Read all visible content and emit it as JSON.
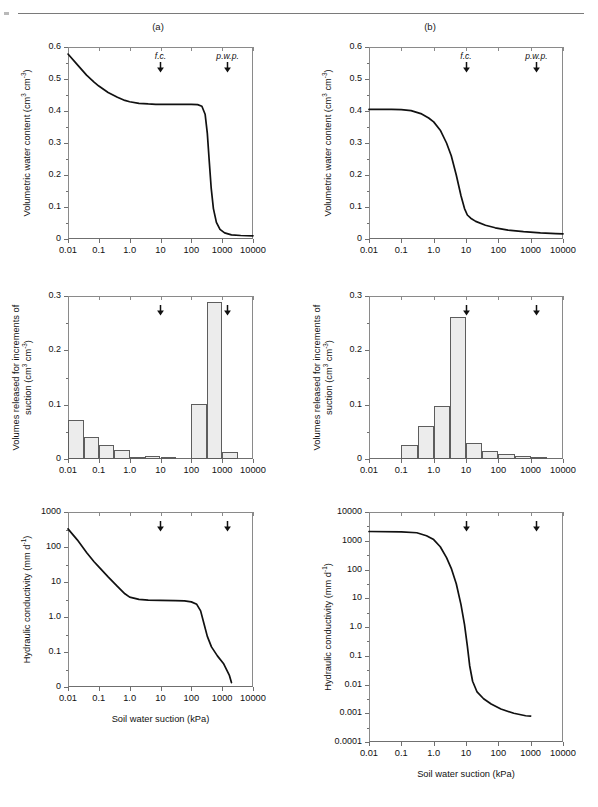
{
  "figure": {
    "panel_labels": [
      "(a)",
      "(b)"
    ],
    "annotations": {
      "fc": "f.c.",
      "pwp": "p.w.p.",
      "fc_x": 10,
      "pwp_x": 1500
    },
    "xaxis_title": "Soil water suction (kPa)",
    "xtick_labels": [
      "0.01",
      "0.1",
      "1.0",
      "10",
      "100",
      "1000",
      "10000"
    ],
    "xtick_values": [
      0.01,
      0.1,
      1,
      10,
      100,
      1000,
      10000
    ],
    "accent_color": "#111111",
    "bar_fill": "#ececec",
    "bar_stroke": "#5d5d5d",
    "axis_color": "#8a8a8a"
  },
  "chart_data": [
    {
      "id": "a-top",
      "type": "line",
      "panel": "(a)",
      "title": "",
      "xlabel": "",
      "ylabel": "Volumetric water content  (cm3 cm-3)",
      "ylabel_parts": {
        "main": "Volumetric water content  (cm",
        "sup1": "3",
        "mid": " cm",
        "sup2": "-3",
        "tail": ")"
      },
      "xscale": "log",
      "xlim": [
        0.01,
        10000
      ],
      "ylim": [
        0,
        0.6
      ],
      "ytick_labels": [
        "0",
        "0.1",
        "0.2",
        "0.3",
        "0.4",
        "0.5",
        "0.6"
      ],
      "ytick_values": [
        0,
        0.1,
        0.2,
        0.3,
        0.4,
        0.5,
        0.6
      ],
      "grid": false,
      "x": [
        0.01,
        0.02,
        0.04,
        0.07,
        0.1,
        0.2,
        0.4,
        0.7,
        1.0,
        2.0,
        4.0,
        7.0,
        10,
        30,
        60,
        100,
        160,
        220,
        280,
        330,
        380,
        440,
        520,
        650,
        850,
        1200,
        2000,
        4000,
        10000
      ],
      "y": [
        0.578,
        0.545,
        0.512,
        0.49,
        0.478,
        0.458,
        0.443,
        0.433,
        0.429,
        0.424,
        0.422,
        0.421,
        0.421,
        0.421,
        0.421,
        0.421,
        0.42,
        0.415,
        0.39,
        0.33,
        0.245,
        0.16,
        0.095,
        0.052,
        0.03,
        0.019,
        0.013,
        0.011,
        0.01
      ]
    },
    {
      "id": "a-mid",
      "type": "bar",
      "panel": "(a)",
      "ylabel": "Volumes released for increments of suction  (cm3 cm-3)",
      "ylabel_line1": "Volumes released for increments of",
      "ylabel_line2_parts": {
        "main": "suction  (cm",
        "sup1": "3",
        "mid": " cm",
        "sup2": "-3",
        "tail": ")"
      },
      "xscale": "log",
      "xlim": [
        0.01,
        10000
      ],
      "ylim": [
        0,
        0.3
      ],
      "ytick_labels": [
        "0",
        "0.1",
        "0.2",
        "0.3"
      ],
      "ytick_values": [
        0,
        0.1,
        0.2,
        0.3
      ],
      "bin_edges": [
        0.01,
        0.032,
        0.1,
        0.32,
        1.0,
        3.2,
        10,
        32,
        100,
        320,
        1000,
        3200
      ],
      "values": [
        0.072,
        0.041,
        0.026,
        0.017,
        0.003,
        0.005,
        0.001,
        0.0,
        0.101,
        0.289,
        0.012
      ],
      "grid": false
    },
    {
      "id": "a-bot",
      "type": "line",
      "panel": "(a)",
      "ylabel": "Hydraulic conductivity (mm d-1)",
      "ylabel_parts": {
        "main": "Hydraulic conductivity (mm d",
        "sup1": "-1",
        "tail": ")"
      },
      "xlabel": "Soil water suction (kPa)",
      "xscale": "log",
      "yscale": "log-with-zero",
      "xlim": [
        0.01,
        10000
      ],
      "ytick_labels": [
        "0",
        "0.1",
        "1.0",
        "10",
        "100",
        "1000"
      ],
      "ytick_values": [
        0,
        0.1,
        1.0,
        10,
        100,
        1000
      ],
      "x": [
        0.01,
        0.02,
        0.04,
        0.07,
        0.1,
        0.2,
        0.4,
        0.7,
        1.0,
        2.0,
        4.0,
        10,
        30,
        60,
        100,
        150,
        200,
        260,
        330,
        450,
        700,
        1100,
        1700,
        2000
      ],
      "y": [
        330,
        160,
        70,
        38,
        27,
        14,
        7.5,
        4.6,
        3.7,
        3.2,
        3.05,
        3.0,
        2.95,
        2.9,
        2.7,
        2.3,
        1.5,
        0.62,
        0.28,
        0.14,
        0.07,
        0.035,
        0.012,
        0.006
      ],
      "grid": false
    },
    {
      "id": "b-top",
      "type": "line",
      "panel": "(b)",
      "ylabel": "Volumetric water content  (cm3 cm-3)",
      "ylabel_parts": {
        "main": "Volumetric water content  (cm",
        "sup1": "3",
        "mid": " cm",
        "sup2": "-3",
        "tail": ")"
      },
      "xscale": "log",
      "xlim": [
        0.01,
        10000
      ],
      "ylim": [
        0,
        0.6
      ],
      "ytick_labels": [
        "0",
        "0.1",
        "0.2",
        "0.3",
        "0.4",
        "0.5",
        "0.6"
      ],
      "ytick_values": [
        0,
        0.1,
        0.2,
        0.3,
        0.4,
        0.5,
        0.6
      ],
      "x": [
        0.01,
        0.05,
        0.1,
        0.2,
        0.4,
        0.7,
        1.0,
        1.6,
        2.5,
        3.5,
        5.0,
        7.0,
        9.0,
        11,
        14,
        20,
        40,
        80,
        200,
        600,
        2000,
        6000,
        10000
      ],
      "y": [
        0.405,
        0.405,
        0.404,
        0.401,
        0.392,
        0.378,
        0.366,
        0.34,
        0.3,
        0.26,
        0.2,
        0.135,
        0.095,
        0.075,
        0.065,
        0.055,
        0.043,
        0.035,
        0.028,
        0.023,
        0.019,
        0.017,
        0.016
      ],
      "grid": false
    },
    {
      "id": "b-mid",
      "type": "bar",
      "panel": "(b)",
      "ylabel": "Volumes released for increments of suction  (cm3 cm-3)",
      "ylabel_line1": "Volumes released for increments of",
      "ylabel_line2_parts": {
        "main": "suction  (cm",
        "sup1": "3",
        "mid": " cm",
        "sup2": "-3",
        "tail": ")"
      },
      "xscale": "log",
      "xlim": [
        0.01,
        10000
      ],
      "ylim": [
        0,
        0.3
      ],
      "ytick_labels": [
        "0",
        "0.1",
        "0.2",
        "0.3"
      ],
      "ytick_values": [
        0,
        0.1,
        0.2,
        0.3
      ],
      "bin_edges": [
        0.1,
        0.32,
        1.0,
        3.2,
        10,
        32,
        100,
        320,
        1000,
        3200
      ],
      "values": [
        0.025,
        0.06,
        0.098,
        0.261,
        0.03,
        0.015,
        0.009,
        0.005,
        0.003
      ],
      "grid": false
    },
    {
      "id": "b-bot",
      "type": "line",
      "panel": "(b)",
      "ylabel": "Hydraulic conductivity (mm d-1)",
      "ylabel_parts": {
        "main": "Hydraulic conductivity (mm d",
        "sup1": "-1",
        "tail": ")"
      },
      "xlabel": "Soil water suction (kPa)",
      "xscale": "log",
      "yscale": "log",
      "xlim": [
        0.01,
        10000
      ],
      "ylim": [
        0.0001,
        10000
      ],
      "ytick_labels": [
        "0.0001",
        "0.001",
        "0.01",
        "0.1",
        "1.0",
        "10",
        "100",
        "1000",
        "10000"
      ],
      "ytick_values": [
        0.0001,
        0.001,
        0.01,
        0.1,
        1.0,
        10,
        100,
        1000,
        10000
      ],
      "x": [
        0.01,
        0.1,
        0.3,
        0.6,
        1.0,
        1.6,
        2.5,
        3.5,
        5.0,
        7.0,
        9.0,
        11,
        13,
        16,
        22,
        35,
        60,
        120,
        300,
        700,
        1000
      ],
      "y": [
        2100,
        2050,
        1900,
        1500,
        1100,
        620,
        260,
        110,
        32,
        6.0,
        1.2,
        0.22,
        0.045,
        0.013,
        0.0055,
        0.0032,
        0.0021,
        0.0014,
        0.001,
        0.00082,
        0.0008
      ],
      "grid": false
    }
  ]
}
